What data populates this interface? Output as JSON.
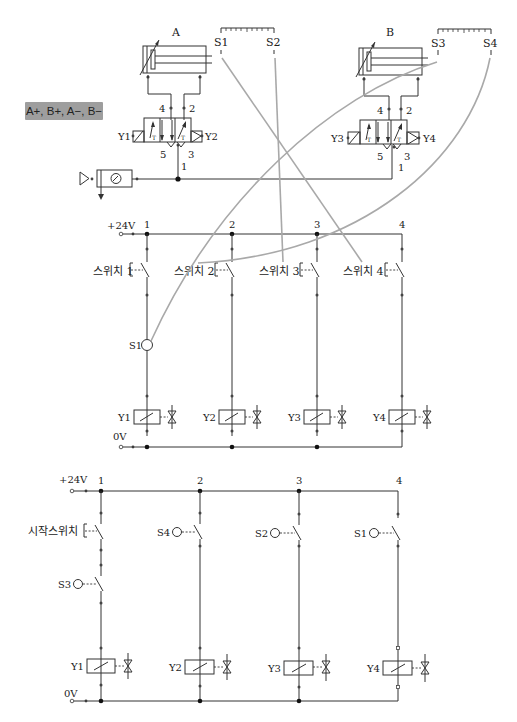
{
  "sequence_label": "A+, B+, A−, B−",
  "pneumatic": {
    "cylinders": [
      {
        "label": "A",
        "x": 150
      },
      {
        "label": "B",
        "x": 368
      }
    ],
    "scales": [
      {
        "left_label": "S1",
        "right_label": "S2",
        "x1": 221,
        "x2": 274
      },
      {
        "left_label": "S3",
        "right_label": "S4",
        "x1": 437,
        "x2": 490
      }
    ],
    "valves": [
      {
        "left_coil": "Y1",
        "right_coil": "Y2",
        "port_a": "4",
        "port_b": "2",
        "exhaust_a": "5",
        "exhaust_b": "3",
        "supply": "1"
      },
      {
        "left_coil": "Y3",
        "right_coil": "Y4",
        "port_a": "4",
        "port_b": "2",
        "exhaust_a": "5",
        "exhaust_b": "3",
        "supply": "1"
      }
    ],
    "service_unit": "filter-regulator-gauge"
  },
  "circuit1": {
    "supply_label": "+24V",
    "ground_label": "0V",
    "rungs": [
      {
        "number": "1",
        "switch": "스위치 1",
        "sensor": "S1",
        "coil": "Y1"
      },
      {
        "number": "2",
        "switch": "스위치 2",
        "coil": "Y2"
      },
      {
        "number": "3",
        "switch": "스위치 3",
        "coil": "Y3"
      },
      {
        "number": "4",
        "switch": "스위치 4",
        "coil": "Y4"
      }
    ]
  },
  "circuit2": {
    "supply_label": "+24V",
    "ground_label": "0V",
    "rungs": [
      {
        "number": "1",
        "switch": "시작스위치",
        "sensor": "S3",
        "coil": "Y1"
      },
      {
        "number": "2",
        "sensor": "S4",
        "coil": "Y2"
      },
      {
        "number": "3",
        "sensor": "S2",
        "coil": "Y3"
      },
      {
        "number": "4",
        "sensor": "S1",
        "coil": "Y4"
      }
    ]
  },
  "connections": [
    {
      "from": "S1",
      "to": "스위치 4"
    },
    {
      "from": "S2",
      "to": "스위치 3"
    },
    {
      "from": "S3",
      "to": "S1 (circuit1 rung 1)"
    },
    {
      "from": "S4",
      "to": "스위치 2"
    }
  ],
  "colors": {
    "line": "#333333",
    "link": "#a9a9a9",
    "label_box": "#9e9e9e"
  }
}
